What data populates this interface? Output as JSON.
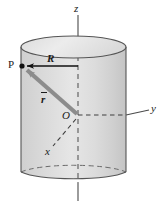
{
  "figure": {
    "background_color": "#ffffff",
    "cylinder": {
      "fill_color": "#d4d4d4",
      "top_cap_fill": "#e3e3e3",
      "outline_color": "#555555",
      "left_x": 21,
      "right_x": 126,
      "top_center_y": 47,
      "bottom_center_y": 172,
      "ellipse_ry": 11
    },
    "labels": {
      "z_axis": "z",
      "y_axis": "y",
      "x_axis": "x",
      "origin": "O",
      "point": "P",
      "radius": "R",
      "vector": "r"
    },
    "colors": {
      "axis_line": "#4a4a4a",
      "vector_arrow": "#8c8c8c",
      "radius_arrow": "#111111",
      "text": "#1a1a1a"
    },
    "geometry": {
      "origin_x": 78,
      "origin_y": 115,
      "point_p_x": 22,
      "point_p_y": 66
    }
  }
}
